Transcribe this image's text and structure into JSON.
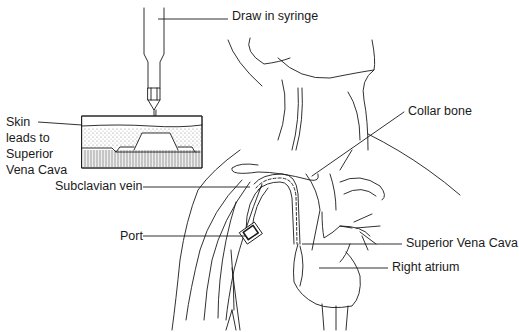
{
  "diagram": {
    "labels": {
      "draw_in_syringe": "Draw in syringe",
      "skin_line1": "Skin",
      "skin_line2": "leads to",
      "skin_line3": "Superior",
      "skin_line4": "Vena Cava",
      "collar_bone": "Collar bone",
      "subclavian_vein": "Subclavian vein",
      "port": "Port",
      "superior_vena_cava": "Superior Vena Cava",
      "right_atrium": "Right atrium"
    },
    "colors": {
      "line": "#1a1a1a",
      "stipple": "#9a9a9a",
      "background": "#ffffff"
    }
  }
}
